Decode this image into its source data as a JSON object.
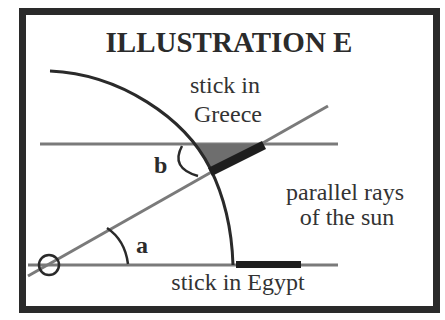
{
  "diagram": {
    "title": "ILLUSTRATION E",
    "labels": {
      "stick_greece_line1": "stick in",
      "stick_greece_line2": "Greece",
      "rays_line1": "parallel rays",
      "rays_line2": "of the sun",
      "stick_egypt": "stick in Egypt",
      "angle_a": "a",
      "angle_b": "b"
    },
    "colors": {
      "frame": "#2a2a2a",
      "ray_line": "#7a7a7a",
      "earth_arc": "#2a2a2a",
      "stick": "#1e1e1e",
      "shadow": "#6e6e6e",
      "background": "#ffffff"
    }
  }
}
